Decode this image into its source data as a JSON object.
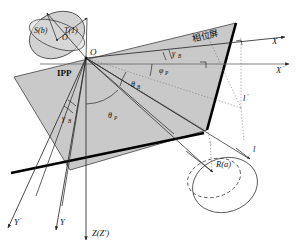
{
  "figure": {
    "title_cjk": "相位屏",
    "origin_label": "O",
    "ipp_label": "IPP",
    "sphere": {
      "s_label": "S(b)",
      "t_label": "T(1)",
      "center_label": "O"
    },
    "axes": [
      {
        "name": "X",
        "label": "X",
        "prime": ""
      },
      {
        "name": "Xp",
        "label": "X",
        "prime": "′"
      },
      {
        "name": "Y",
        "label": "Y",
        "prime": ""
      },
      {
        "name": "Yp",
        "label": "Y",
        "prime": "′"
      },
      {
        "name": "Z",
        "label": "Z(Z′)",
        "prime": ""
      }
    ],
    "angles": [
      {
        "name": "gamma-b-right",
        "base": "γ",
        "sub": "B"
      },
      {
        "name": "gamma-b-left",
        "base": "γ",
        "sub": "B"
      },
      {
        "name": "phi-p",
        "base": "φ",
        "sub": "P"
      },
      {
        "name": "theta-b",
        "base": "θ",
        "sub": "B"
      },
      {
        "name": "theta-p",
        "base": "θ",
        "sub": "P"
      }
    ],
    "lengths": [
      {
        "name": "l-prime",
        "label": "l",
        "prime": "′"
      },
      {
        "name": "l",
        "label": "l",
        "prime": ""
      }
    ],
    "ray": {
      "r_label": "R(a)"
    },
    "colors": {
      "plane_fill": "#c9c9c9",
      "sphere_fill": "#d2d2d2",
      "line": "#2b2b2b",
      "thick_edge": "#000000",
      "dotted": "#7a7a7a",
      "background": "#ffffff"
    }
  }
}
